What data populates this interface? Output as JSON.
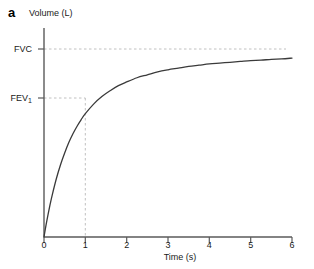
{
  "figure": {
    "panel_label": "a",
    "background_color": "#ffffff",
    "curve_color": "#3a3a3a",
    "axis_color": "#555555",
    "guide_color": "#bdbdbd"
  },
  "chart_data": {
    "type": "line",
    "title": "",
    "subtitle": "",
    "xlabel": "Time (s)",
    "ylabel": "Volume (L)",
    "xlim": [
      0,
      6
    ],
    "ylim": [
      0,
      5.0
    ],
    "grid": false,
    "legend": "none",
    "xticks": [
      0,
      1,
      2,
      3,
      4,
      5,
      6
    ],
    "xtick_labels": [
      "0",
      "1",
      "2",
      "3",
      "4",
      "5",
      "6"
    ],
    "ytick_labels": [
      "FVC",
      "FEV1"
    ],
    "ytick_values": [
      4.55,
      3.5
    ],
    "series": [
      {
        "name": "Forced expiratory volume-time curve",
        "x": [
          0.0,
          0.05,
          0.1,
          0.15,
          0.2,
          0.3,
          0.4,
          0.5,
          0.6,
          0.7,
          0.8,
          0.9,
          1.0,
          1.2,
          1.4,
          1.6,
          1.8,
          2.0,
          2.25,
          2.5,
          2.75,
          3.0,
          3.25,
          3.5,
          3.75,
          4.0,
          4.25,
          4.5,
          4.75,
          5.0,
          5.25,
          5.5,
          5.75,
          6.0
        ],
        "y": [
          0.0,
          0.29,
          0.55,
          0.79,
          1.01,
          1.4,
          1.73,
          2.01,
          2.26,
          2.47,
          2.65,
          2.81,
          2.95,
          3.18,
          3.36,
          3.5,
          3.62,
          3.71,
          3.81,
          3.88,
          3.95,
          4.0,
          4.04,
          4.08,
          4.11,
          4.14,
          4.16,
          4.18,
          4.2,
          4.22,
          4.23,
          4.25,
          4.26,
          4.28
        ]
      }
    ],
    "annotations": [
      {
        "name": "fvc-guide",
        "type": "hline",
        "label": "FVC",
        "value": 4.55,
        "style": "dashed"
      },
      {
        "name": "fev1-guide",
        "type": "hline",
        "label": "FEV1",
        "value": 3.5,
        "style": "dashed"
      },
      {
        "name": "one-second-guide",
        "type": "vline",
        "label": "1",
        "value": 1.0,
        "style": "dashed"
      }
    ]
  }
}
